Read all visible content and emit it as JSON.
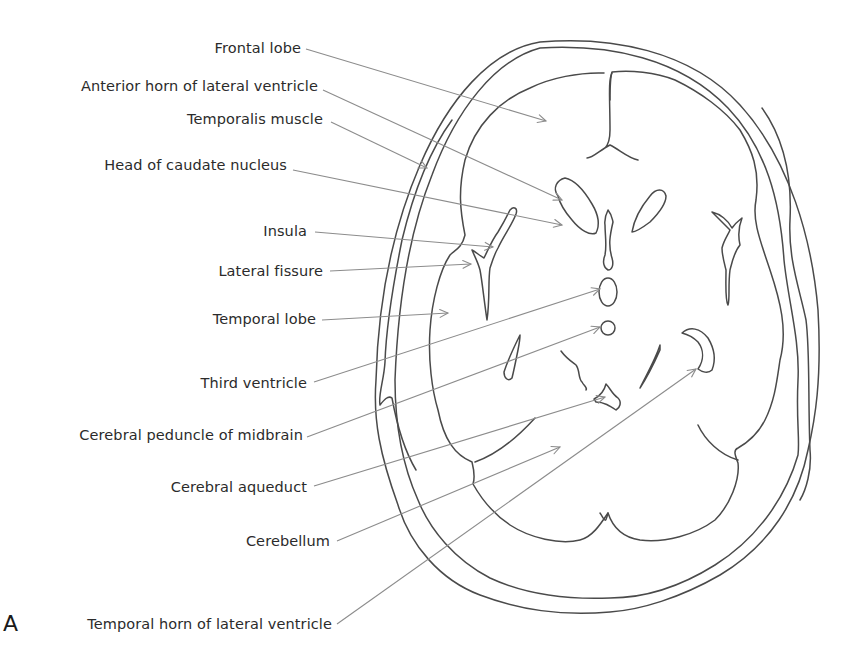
{
  "figure": {
    "panel_letter": "A",
    "line_color": "#4a4a4a",
    "leader_color": "#8c8c8c",
    "text_color": "#2b2b2b"
  },
  "labels": [
    {
      "id": "frontal-lobe",
      "text": "Frontal lobe",
      "text_right_x": 301,
      "text_y": 39,
      "line": [
        306,
        49,
        546,
        121
      ]
    },
    {
      "id": "anterior-horn-lateral-ventricle",
      "text": "Anterior horn of lateral ventricle",
      "text_right_x": 318,
      "text_y": 77,
      "line": [
        323,
        90,
        562,
        200
      ]
    },
    {
      "id": "temporalis-muscle",
      "text": "Temporalis muscle",
      "text_right_x": 323,
      "text_y": 110,
      "line": [
        331,
        122,
        427,
        168
      ]
    },
    {
      "id": "head-of-caudate-nucleus",
      "text": "Head of caudate nucleus",
      "text_right_x": 287,
      "text_y": 156,
      "line": [
        293,
        170,
        562,
        225
      ]
    },
    {
      "id": "insula",
      "text": "Insula",
      "text_right_x": 307,
      "text_y": 222,
      "line": [
        315,
        232,
        493,
        247
      ]
    },
    {
      "id": "lateral-fissure",
      "text": "Lateral fissure",
      "text_right_x": 323,
      "text_y": 262,
      "line": [
        330,
        271,
        471,
        264
      ]
    },
    {
      "id": "temporal-lobe",
      "text": "Temporal lobe",
      "text_right_x": 316,
      "text_y": 310,
      "line": [
        322,
        320,
        448,
        313
      ]
    },
    {
      "id": "third-ventricle",
      "text": "Third ventricle",
      "text_right_x": 307,
      "text_y": 374,
      "line": [
        314,
        382,
        600,
        289
      ]
    },
    {
      "id": "cerebral-peduncle-of-midbrain",
      "text": "Cerebral peduncle of midbrain",
      "text_right_x": 303,
      "text_y": 426,
      "line": [
        307,
        437,
        600,
        327
      ]
    },
    {
      "id": "cerebral-aqueduct",
      "text": "Cerebral aqueduct",
      "text_right_x": 307,
      "text_y": 478,
      "line": [
        314,
        486,
        605,
        397
      ]
    },
    {
      "id": "cerebellum",
      "text": "Cerebellum",
      "text_right_x": 330,
      "text_y": 532,
      "line": [
        337,
        541,
        560,
        447
      ]
    },
    {
      "id": "temporal-horn-lateral-ventricle",
      "text": "Temporal horn of lateral ventricle",
      "text_right_x": 332,
      "text_y": 615,
      "line": [
        337,
        624,
        696,
        369
      ]
    }
  ]
}
